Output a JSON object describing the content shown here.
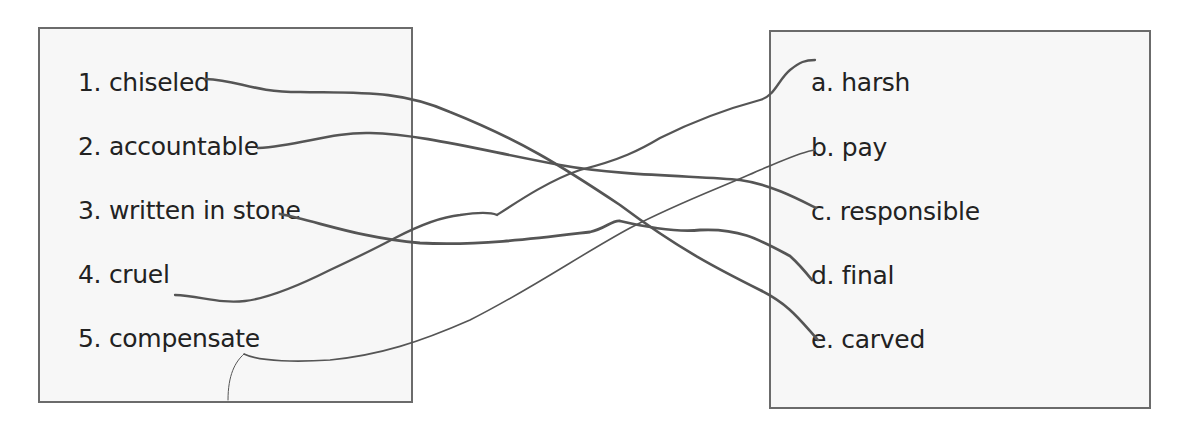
{
  "worksheet": {
    "left_column": {
      "items": [
        {
          "number": "1.",
          "text": "chiseled",
          "label": "1. chiseled"
        },
        {
          "number": "2.",
          "text": "accountable",
          "label": "2. accountable"
        },
        {
          "number": "3.",
          "text": "written in stone",
          "label": "3. written in stone"
        },
        {
          "number": "4.",
          "text": "cruel",
          "label": "4. cruel"
        },
        {
          "number": "5.",
          "text": "compensate",
          "label": "5. compensate"
        }
      ]
    },
    "right_column": {
      "items": [
        {
          "letter": "a.",
          "text": "harsh",
          "label": "a. harsh"
        },
        {
          "letter": "b.",
          "text": "pay",
          "label": "b. pay"
        },
        {
          "letter": "c.",
          "text": "responsible",
          "label": "c. responsible"
        },
        {
          "letter": "d.",
          "text": "final",
          "label": "d. final"
        },
        {
          "letter": "e.",
          "text": "carved",
          "label": "e. carved"
        }
      ]
    },
    "matches": [
      {
        "from": "1",
        "to": "e"
      },
      {
        "from": "2",
        "to": "c"
      },
      {
        "from": "3",
        "to": "d"
      },
      {
        "from": "4",
        "to": "a"
      },
      {
        "from": "5",
        "to": "b"
      }
    ],
    "colors": {
      "line": "#555555",
      "box_border": "#6b6b6b",
      "box_fill": "#f7f7f7",
      "text": "#222222"
    }
  }
}
